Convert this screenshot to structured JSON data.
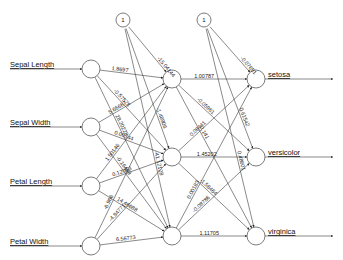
{
  "diagram": {
    "type": "neural-network",
    "inputs": [
      {
        "label": "Sepal Length",
        "x": 91,
        "y": 69
      },
      {
        "label": "Sepal Width",
        "x": 91,
        "y": 127
      },
      {
        "label": "Petal Length",
        "x": 91,
        "y": 186
      },
      {
        "label": "Petal Width",
        "x": 91,
        "y": 246
      }
    ],
    "bias_nodes": [
      {
        "label": "1",
        "x": 123,
        "y": 20
      },
      {
        "label": "1",
        "x": 204,
        "y": 20
      }
    ],
    "hidden": [
      {
        "x": 172,
        "y": 79
      },
      {
        "x": 172,
        "y": 157
      },
      {
        "x": 172,
        "y": 236
      }
    ],
    "outputs": [
      {
        "label": "setosa",
        "x": 256,
        "y": 79
      },
      {
        "label": "versicolor",
        "x": 256,
        "y": 157
      },
      {
        "label": "virginica",
        "x": 256,
        "y": 236
      }
    ],
    "weights": {
      "in_hidden": [
        [
          "1.8697",
          "-0.57578",
          "28.20228"
        ],
        [
          "5.66667",
          "0.00344",
          "-0.16499"
        ],
        [
          "1.50146",
          "0.12063",
          "14.46688"
        ],
        [
          "-6.966",
          "-4.84771",
          "6.56773"
        ]
      ],
      "bias_hidden": [
        "-15.04144",
        "-1.48906",
        "-41.12128"
      ],
      "hidden_out": [
        [
          "1.00787",
          "-0.05961",
          "-0.141"
        ],
        [
          "0.08441",
          "1.45202",
          "-1.58464"
        ],
        [
          "0.00183",
          "-0.08786",
          "1.11705"
        ]
      ],
      "bias_out": [
        "-0.07651",
        "0.61542",
        "0.48601"
      ]
    }
  }
}
